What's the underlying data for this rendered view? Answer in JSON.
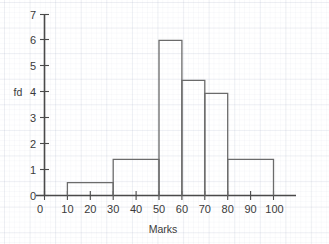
{
  "chart_data": {
    "type": "bar",
    "title": "",
    "subtitle": "",
    "xlabel": "Marks",
    "ylabel": "fd",
    "xlim": [
      0,
      100
    ],
    "ylim": [
      0,
      7
    ],
    "grid": true,
    "legend": "none",
    "note": "Histogram of frequency density against marks; unequal class widths",
    "xticks": [
      0,
      10,
      20,
      30,
      40,
      50,
      60,
      70,
      80,
      90,
      100
    ],
    "xtick_labels": [
      "0",
      "10",
      "20",
      "30",
      "40",
      "50",
      "60",
      "70",
      "80",
      "90",
      "100"
    ],
    "yticks": [
      0,
      1,
      2,
      3,
      4,
      5,
      6,
      7
    ],
    "ytick_labels": [
      "0",
      "1",
      "2",
      "3",
      "4",
      "5",
      "6",
      "7"
    ],
    "categories": [
      "10-30",
      "30-50",
      "50-60",
      "60-70",
      "70-80",
      "80-100"
    ],
    "bins": [
      {
        "label": "10-30",
        "x_start": 10,
        "x_end": 30,
        "value": 0.5
      },
      {
        "label": "30-50",
        "x_start": 30,
        "x_end": 50,
        "value": 1.4
      },
      {
        "label": "50-60",
        "x_start": 50,
        "x_end": 60,
        "value": 6.0
      },
      {
        "label": "60-70",
        "x_start": 60,
        "x_end": 70,
        "value": 4.45
      },
      {
        "label": "70-80",
        "x_start": 70,
        "x_end": 80,
        "value": 3.95
      },
      {
        "label": "80-100",
        "x_start": 80,
        "x_end": 100,
        "value": 1.4
      }
    ],
    "values": [
      0.5,
      1.4,
      6.0,
      4.45,
      3.95,
      1.4
    ],
    "colors": {
      "bar_stroke": "#6b6b6b",
      "bar_fill": "none",
      "axis": "#4a4a4a",
      "text": "#3a3a3a",
      "grid": "#c8cfdd",
      "background": "#ffffff"
    }
  },
  "axes": {
    "x_axis_title": "Marks",
    "y_axis_title": "fd"
  }
}
